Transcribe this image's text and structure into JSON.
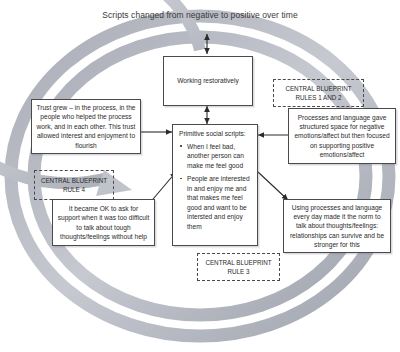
{
  "diagram": {
    "title": "Scripts changed from negative to positive over time",
    "cycle_ring_color": "#b9bcc4",
    "box_border_color": "#4a4a4a",
    "nodes": {
      "working_restoratively": "Working restoratively",
      "trust_grew": "Trust grew – in the process, in the people who helped the process work, and in each other. This trust allowed interest and enjoyment to flourish",
      "processes_language": "Processes and language gave structured space for negative emotions/affect but then focused on supporting positive emotions/affect",
      "became_ok": "It became OK to ask for support when it was too difficult to talk about tough thoughts/feelings without help",
      "using_processes": "Using processes and language every day made it the norm to talk about thoughts/feelings: relationships can survive and be stronger for this"
    },
    "center": {
      "header": "Primitive social scripts:",
      "bullets": [
        "When I feel bad, another person can make me feel good",
        "People are interested in and enjoy me and that makes me feel good and want to be intersted and enjoy them"
      ]
    },
    "blueprint_labels": {
      "rules_1_and_2": "CENTRAL BLUEPRINT RULES 1 AND 2",
      "rule_3": "CENTRAL BLUEPRINT RULE 3",
      "rule_4": "CENTRAL BLUEPRINT RULE 4"
    }
  }
}
